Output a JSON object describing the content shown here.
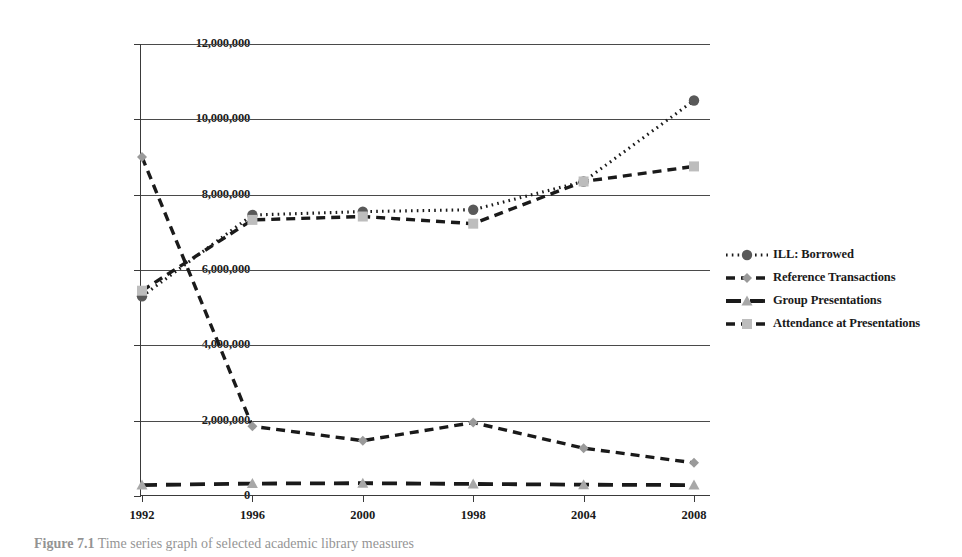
{
  "figure": {
    "caption_label": "Figure 7.1",
    "caption_text": "Time series graph of selected academic library measures"
  },
  "chart_data": {
    "type": "line",
    "title": "",
    "xlabel": "",
    "ylabel": "",
    "categories": [
      "1992",
      "1996",
      "2000",
      "1998",
      "2004",
      "2008"
    ],
    "x_tick_labels": [
      "1992",
      "1996",
      "2000",
      "1998",
      "2004",
      "2008"
    ],
    "y_tick_labels": [
      "0",
      "2,000,000",
      "4,000,000",
      "6,000,000",
      "8,000,000",
      "10,000,000",
      "12,000,000"
    ],
    "y_tick_values": [
      0,
      2000000,
      4000000,
      6000000,
      8000000,
      10000000,
      12000000
    ],
    "ylim": [
      0,
      12000000
    ],
    "grid": true,
    "legend_position": "right",
    "series": [
      {
        "name": "ILL: Borrowed",
        "marker": "circle",
        "line_style": "dotted",
        "color": "#1a1a1a",
        "marker_color": "#595959",
        "values": [
          5300000,
          7460000,
          7550000,
          7600000,
          8350000,
          10500000
        ]
      },
      {
        "name": "Reference Transactions",
        "marker": "diamond",
        "line_style": "dashed",
        "color": "#1a1a1a",
        "marker_color": "#9a9a9a",
        "values": [
          9000000,
          1850000,
          1470000,
          1950000,
          1270000,
          880000
        ]
      },
      {
        "name": "Group Presentations",
        "marker": "triangle",
        "line_style": "long-dash",
        "color": "#1a1a1a",
        "marker_color": "#a8a8a8",
        "values": [
          290000,
          330000,
          340000,
          320000,
          300000,
          290000
        ]
      },
      {
        "name": "Attendance at Presentations",
        "marker": "square",
        "line_style": "dashed",
        "color": "#1a1a1a",
        "marker_color": "#bdbdbd",
        "values": [
          5450000,
          7330000,
          7420000,
          7230000,
          8350000,
          8750000
        ]
      }
    ]
  }
}
